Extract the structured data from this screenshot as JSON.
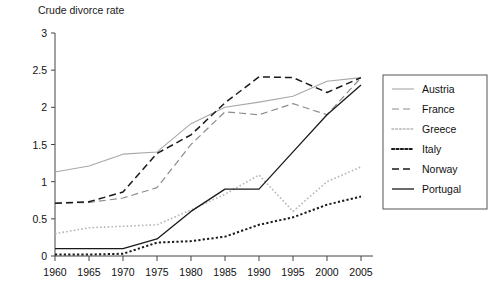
{
  "chart_data": {
    "type": "line",
    "title": "Crude divorce rate",
    "xlabel": "",
    "ylabel": "",
    "xlim": [
      1960,
      2005
    ],
    "ylim": [
      0,
      3
    ],
    "grid": false,
    "legend_position": "right",
    "x": [
      1960,
      1965,
      1970,
      1975,
      1980,
      1985,
      1990,
      1995,
      2000,
      2005
    ],
    "xticks": [
      "1960",
      "1965",
      "1970",
      "1975",
      "1980",
      "1985",
      "1990",
      "1995",
      "2000",
      "2005"
    ],
    "yticks": [
      "0",
      "0.5",
      "1",
      "1.5",
      "2",
      "2.5",
      "3"
    ],
    "ytick_values": [
      0,
      0.5,
      1,
      1.5,
      2,
      2.5,
      3
    ],
    "series": [
      {
        "name": "Austria",
        "style": "solid",
        "color": "#a8a8a8",
        "width": 1.1,
        "values": [
          1.13,
          1.21,
          1.37,
          1.4,
          1.78,
          2.0,
          2.07,
          2.15,
          2.35,
          2.4
        ]
      },
      {
        "name": "France",
        "style": "dashed",
        "color": "#8c8c8c",
        "width": 1.2,
        "values": [
          0.71,
          0.72,
          0.78,
          0.92,
          1.5,
          1.94,
          1.9,
          2.05,
          1.9,
          2.4
        ]
      },
      {
        "name": "Greece",
        "style": "dotted",
        "color": "#b5b5b5",
        "width": 1.6,
        "values": [
          0.3,
          0.38,
          0.4,
          0.42,
          0.62,
          0.83,
          1.09,
          0.6,
          1.0,
          1.2
        ]
      },
      {
        "name": "Italy",
        "style": "dotted",
        "color": "#1a1a1a",
        "width": 2.0,
        "values": [
          0.02,
          0.02,
          0.03,
          0.18,
          0.2,
          0.26,
          0.42,
          0.52,
          0.69,
          0.8
        ]
      },
      {
        "name": "Norway",
        "style": "dashed",
        "color": "#1a1a1a",
        "width": 1.5,
        "values": [
          0.71,
          0.73,
          0.86,
          1.38,
          1.63,
          2.06,
          2.41,
          2.4,
          2.2,
          2.4
        ]
      },
      {
        "name": "Portugal",
        "style": "solid",
        "color": "#1a1a1a",
        "width": 1.3,
        "values": [
          0.1,
          0.1,
          0.1,
          0.23,
          0.6,
          0.9,
          0.9,
          1.4,
          1.9,
          2.3
        ]
      }
    ]
  },
  "legend": {
    "entries": [
      {
        "label": "Austria"
      },
      {
        "label": "France"
      },
      {
        "label": "Greece"
      },
      {
        "label": "Italy"
      },
      {
        "label": "Norway"
      },
      {
        "label": "Portugal"
      }
    ]
  },
  "colors": {
    "axis": "#444444",
    "text": "#111111",
    "background": "#ffffff",
    "legend_border": "#555555"
  }
}
